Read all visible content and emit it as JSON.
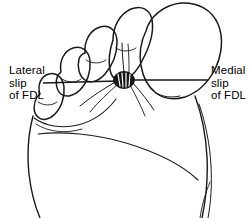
{
  "figure": {
    "kind": "anatomical-line-drawing",
    "background_color": "#ffffff",
    "ink_color": "#1a1a1a",
    "width": 249,
    "height": 218
  },
  "labels": {
    "lateral": {
      "line1": "Lateral",
      "line2": "slip",
      "line3": "of FDL"
    },
    "medial": {
      "line1": "Medial",
      "line2": "slip",
      "line3": "of FDL"
    }
  },
  "annotations": {
    "lateral_leader": {
      "name": "lateral-leader-line",
      "x1": 43,
      "y1": 83,
      "x2": 117,
      "y2": 81
    },
    "medial_leader": {
      "name": "medial-leader-line",
      "x1": 132,
      "y1": 80,
      "x2": 208,
      "y2": 80
    },
    "tendon_marker": {
      "name": "fdl-tendon-insertion",
      "cx": 124,
      "cy": 80,
      "fill": "#161616",
      "description": "dark lens-shaped tendon with radiating light striations"
    }
  }
}
